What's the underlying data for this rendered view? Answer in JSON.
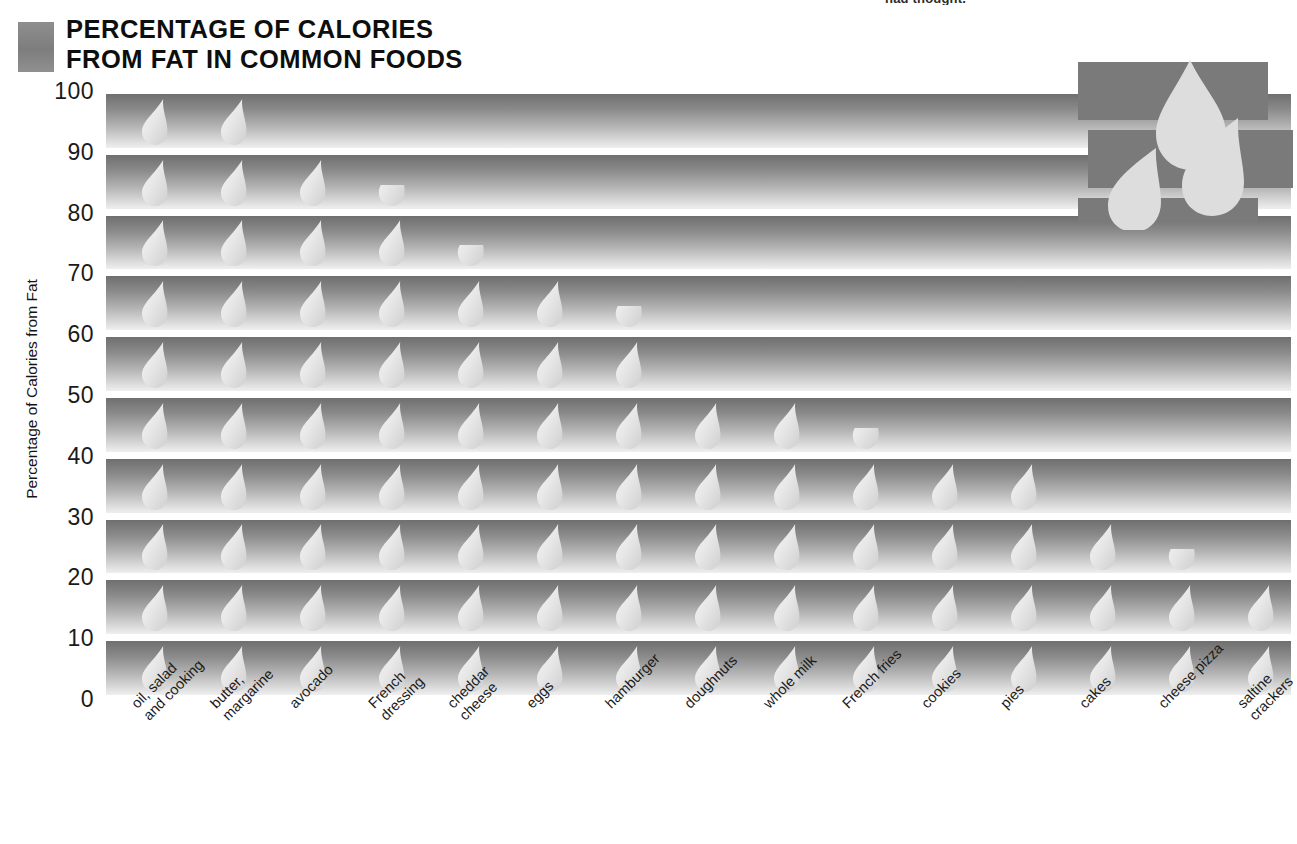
{
  "header": {
    "title_line1": "PERCENTAGE OF CALORIES",
    "title_line2": "FROM FAT IN COMMON FOODS",
    "cutoff_note": "had thought.",
    "swatch_color": "#8e8e8e"
  },
  "logo": {
    "name": "three-droplets-logo",
    "block_color": "#7a7a7a",
    "droplet_color": "#dcdcdc"
  },
  "axis": {
    "y_title": "Percentage of Calories from Fat",
    "y_ticks": [
      "100",
      "90",
      "80",
      "70",
      "60",
      "50",
      "40",
      "30",
      "20",
      "10",
      "0"
    ]
  },
  "chart_data": {
    "type": "bar",
    "title": "PERCENTAGE OF CALORIES FROM FAT IN COMMON FOODS",
    "subtitle": "",
    "xlabel": "",
    "ylabel": "Percentage of Calories from Fat",
    "ylim": [
      0,
      100
    ],
    "ytick_step": 10,
    "grid": false,
    "legend": "none",
    "orientation": "vertical-pictogram",
    "unit_symbol": "droplet",
    "unit_value": 10,
    "categories": [
      "oil, salad\nand cooking",
      "butter,\nmargarine",
      "avocado",
      "French\ndressing",
      "cheddar\ncheese",
      "eggs",
      "hamburger",
      "doughnuts",
      "whole milk",
      "French fries",
      "cookies",
      "pies",
      "cakes",
      "cheese pizza",
      "saltine\ncrackers"
    ],
    "values": [
      100,
      100,
      90,
      85,
      75,
      70,
      65,
      50,
      50,
      45,
      40,
      40,
      30,
      25,
      20
    ],
    "value_labels": [
      "100",
      "100",
      "90",
      "85",
      "75",
      "70",
      "65",
      "50",
      "50",
      "45",
      "40",
      "40",
      "30",
      "25",
      "20"
    ],
    "rows": [
      {
        "level": "100",
        "full_count": 2,
        "partial": false
      },
      {
        "level": "90",
        "full_count": 3,
        "partial": true
      },
      {
        "level": "80",
        "full_count": 4,
        "partial": true
      },
      {
        "level": "70",
        "full_count": 6,
        "partial": true
      },
      {
        "level": "60",
        "full_count": 7,
        "partial": false
      },
      {
        "level": "50",
        "full_count": 9,
        "partial": true
      },
      {
        "level": "40",
        "full_count": 12,
        "partial": false
      },
      {
        "level": "30",
        "full_count": 13,
        "partial": true
      },
      {
        "level": "20",
        "full_count": 15,
        "partial": false
      },
      {
        "level": "10",
        "full_count": 15,
        "partial": false
      }
    ]
  },
  "colors": {
    "band_dark": "#6f6f6f",
    "band_light": "#efefef",
    "droplet": "#e3e3e3",
    "text": "#1a1a1a"
  }
}
